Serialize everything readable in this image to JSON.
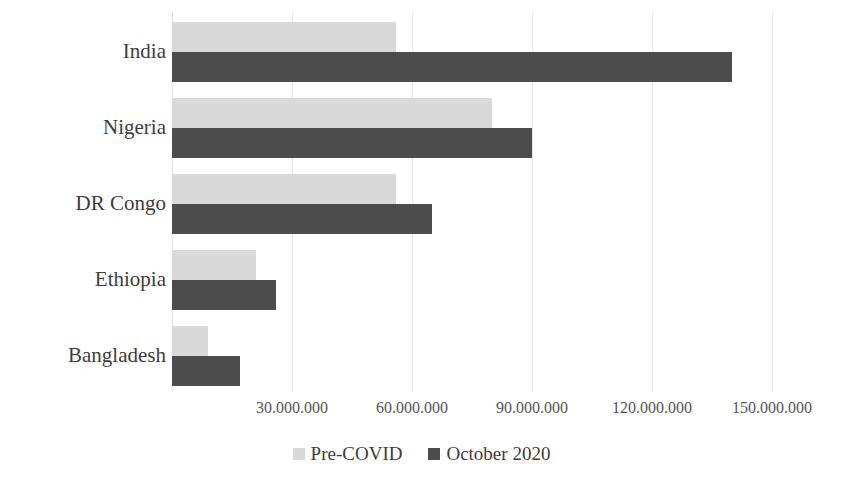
{
  "chart_data": {
    "type": "bar",
    "orientation": "horizontal",
    "title": "",
    "subtitle": "",
    "xlabel": "",
    "ylabel": "",
    "categories": [
      "India",
      "Nigeria",
      "DR Congo",
      "Ethiopia",
      "Bangladesh"
    ],
    "series": [
      {
        "name": "Pre-COVID",
        "color": "#d9d9d9",
        "values": [
          56000000,
          80000000,
          56000000,
          21000000,
          9000000
        ]
      },
      {
        "name": "October 2020",
        "color": "#4c4c4c",
        "values": [
          140000000,
          90000000,
          65000000,
          26000000,
          17000000
        ]
      }
    ],
    "xlim": [
      0,
      150000000
    ],
    "xticks": [
      30000000,
      60000000,
      90000000,
      120000000,
      150000000
    ],
    "xtick_labels": [
      "30.000.000",
      "60.000.000",
      "90.000.000",
      "120.000.000",
      "150.000.000"
    ],
    "grid": true,
    "grid_axis": "x",
    "grid_color": "#e9e9e9",
    "legend": [
      "Pre-COVID",
      "October 2020"
    ],
    "legend_position": "bottom"
  },
  "axis": {
    "ticks": [
      {
        "label": "30.000.000",
        "value": 30000000
      },
      {
        "label": "60.000.000",
        "value": 60000000
      },
      {
        "label": "90.000.000",
        "value": 90000000
      },
      {
        "label": "120.000.000",
        "value": 120000000
      },
      {
        "label": "150.000.000",
        "value": 150000000
      }
    ]
  },
  "categories": [
    {
      "label": "India"
    },
    {
      "label": "Nigeria"
    },
    {
      "label": "DR Congo"
    },
    {
      "label": "Ethiopia"
    },
    {
      "label": "Bangladesh"
    }
  ],
  "legend": {
    "items": [
      {
        "label": "Pre-COVID",
        "color": "#d9d9d9"
      },
      {
        "label": "October 2020",
        "color": "#4c4c4c"
      }
    ]
  }
}
